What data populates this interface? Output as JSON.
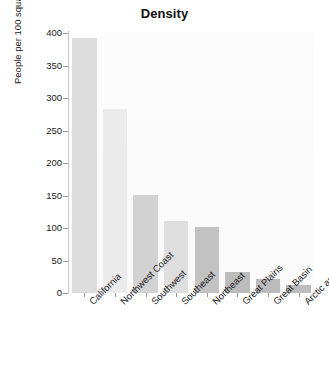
{
  "chart_data": {
    "type": "bar",
    "title": "Density",
    "xlabel": "",
    "ylabel": "People per 100 square miles (approx.)",
    "categories": [
      "California",
      "Northwest Coast",
      "Southwest",
      "Southeast",
      "Northeast",
      "Great Plains",
      "Great Basin",
      "Arctic and Sub-Arctic"
    ],
    "values": [
      392,
      283,
      151,
      111,
      101,
      32,
      21,
      12
    ],
    "ylim": [
      0,
      400
    ],
    "yticks": [
      0,
      50,
      100,
      150,
      200,
      250,
      300,
      350,
      400
    ],
    "ytick_labels": [
      "0",
      "50",
      "100",
      "150",
      "200",
      "250",
      "300",
      "350",
      "400"
    ],
    "grid": false,
    "legend": null,
    "bar_colors": [
      "#dddddd",
      "#ebebeb",
      "#d2d2d2",
      "#dedede",
      "#c2c2c2",
      "#bcbcbc",
      "#bcbcbc",
      "#bcbcbc"
    ]
  }
}
